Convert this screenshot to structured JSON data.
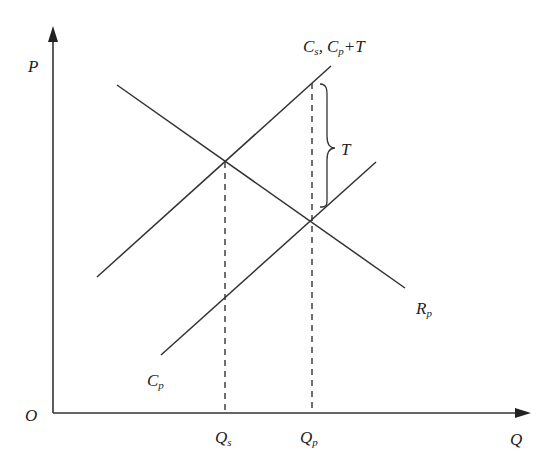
{
  "diagram": {
    "type": "supply-demand tax diagram",
    "axes": {
      "y_label": "P",
      "x_label": "Q",
      "origin_label": "O"
    },
    "curves": {
      "cs_line": {
        "label_main": "C",
        "label_sub": "s",
        "combined_label_sep": ",",
        "combined_main": "C",
        "combined_sub": "p",
        "combined_suffix": "+T"
      },
      "cp_line": {
        "label_main": "C",
        "label_sub": "p"
      },
      "rp_line": {
        "label_main": "R",
        "label_sub": "p"
      }
    },
    "tax_brace": {
      "label": "T"
    },
    "x_ticks": [
      {
        "main": "Q",
        "sub": "s"
      },
      {
        "main": "Q",
        "sub": "p"
      }
    ],
    "colors": {
      "line": "#333333",
      "background": "#ffffff"
    }
  }
}
